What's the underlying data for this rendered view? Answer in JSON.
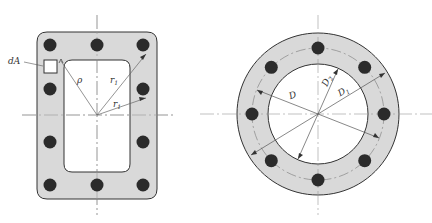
{
  "figure": {
    "left": {
      "title": "rectangular-hollow-section",
      "labels": {
        "dA": "dA",
        "rho": "ρ",
        "r1_upper": "r",
        "r1_upper_sub": "1",
        "r1_lower": "r",
        "r1_lower_sub": "1"
      },
      "bolt_count": 10
    },
    "right": {
      "title": "annular-section",
      "labels": {
        "D": "D",
        "D2": "D",
        "D2_sub": "2",
        "D1": "D",
        "D1_sub": "1"
      },
      "bolt_count": 8
    },
    "colors": {
      "fill": "#d9d9d9",
      "stroke": "#333333",
      "bolt": "#2b2b2b",
      "centerline": "#999999"
    }
  }
}
